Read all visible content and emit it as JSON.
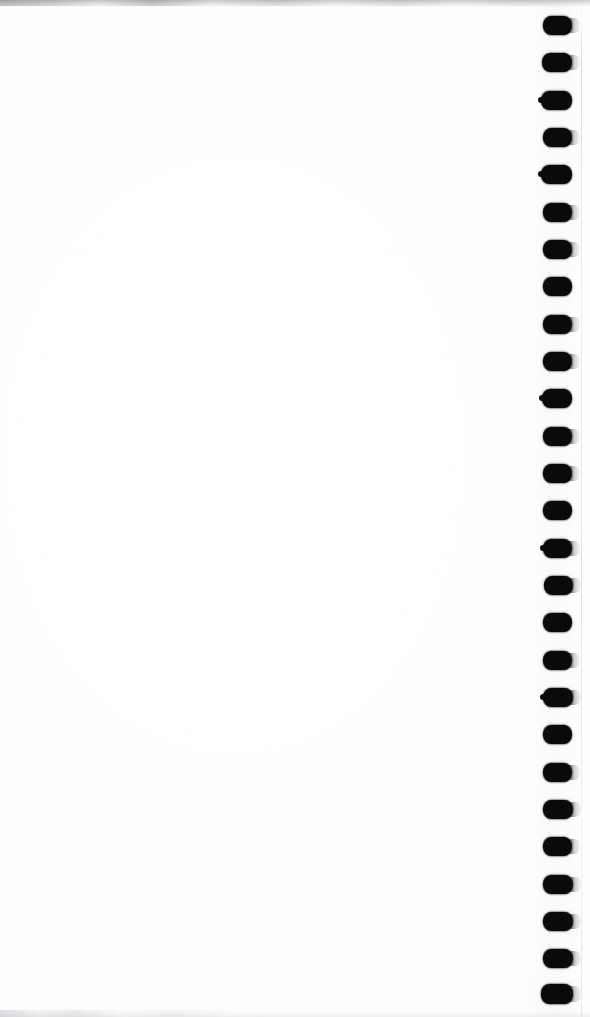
{
  "document": {
    "title": "Scanned blank page",
    "kind": "scanned-paper-page",
    "page_content_text": "",
    "width_px": 590,
    "height_px": 1017,
    "background_color": "#fefefe",
    "paper_color": "#ffffff"
  },
  "binder_holes": {
    "label": "punched binder holes",
    "count": 27,
    "shape": "rounded-rectangle",
    "color": "#0a0a0a",
    "column_left_px": 541,
    "hole_width_px": 30,
    "hole_height_px": 19,
    "first_hole_top_px": 16,
    "vertical_spacing_px": 37.3,
    "holes": [
      {
        "index": 1,
        "top": 16,
        "left": 543,
        "width": 29,
        "height": 19,
        "bleed": true,
        "nick": false
      },
      {
        "index": 2,
        "top": 53,
        "left": 542,
        "width": 30,
        "height": 19,
        "bleed": true,
        "nick": false
      },
      {
        "index": 3,
        "top": 91,
        "left": 541,
        "width": 31,
        "height": 19,
        "bleed": false,
        "nick": true
      },
      {
        "index": 4,
        "top": 128,
        "left": 543,
        "width": 29,
        "height": 19,
        "bleed": true,
        "nick": false
      },
      {
        "index": 5,
        "top": 165,
        "left": 541,
        "width": 31,
        "height": 19,
        "bleed": false,
        "nick": true
      },
      {
        "index": 6,
        "top": 203,
        "left": 543,
        "width": 29,
        "height": 19,
        "bleed": true,
        "nick": false
      },
      {
        "index": 7,
        "top": 240,
        "left": 543,
        "width": 29,
        "height": 19,
        "bleed": true,
        "nick": false
      },
      {
        "index": 8,
        "top": 277,
        "left": 543,
        "width": 29,
        "height": 19,
        "bleed": false,
        "nick": false
      },
      {
        "index": 9,
        "top": 315,
        "left": 543,
        "width": 29,
        "height": 19,
        "bleed": true,
        "nick": false
      },
      {
        "index": 10,
        "top": 352,
        "left": 543,
        "width": 29,
        "height": 19,
        "bleed": true,
        "nick": false
      },
      {
        "index": 11,
        "top": 389,
        "left": 542,
        "width": 30,
        "height": 19,
        "bleed": false,
        "nick": true
      },
      {
        "index": 12,
        "top": 427,
        "left": 543,
        "width": 29,
        "height": 19,
        "bleed": true,
        "nick": false
      },
      {
        "index": 13,
        "top": 464,
        "left": 543,
        "width": 29,
        "height": 19,
        "bleed": true,
        "nick": false
      },
      {
        "index": 14,
        "top": 501,
        "left": 543,
        "width": 29,
        "height": 19,
        "bleed": false,
        "nick": false
      },
      {
        "index": 15,
        "top": 539,
        "left": 543,
        "width": 29,
        "height": 19,
        "bleed": true,
        "nick": true
      },
      {
        "index": 16,
        "top": 576,
        "left": 544,
        "width": 29,
        "height": 19,
        "bleed": true,
        "nick": false
      },
      {
        "index": 17,
        "top": 613,
        "left": 543,
        "width": 29,
        "height": 19,
        "bleed": false,
        "nick": false
      },
      {
        "index": 18,
        "top": 651,
        "left": 543,
        "width": 29,
        "height": 19,
        "bleed": true,
        "nick": false
      },
      {
        "index": 19,
        "top": 688,
        "left": 543,
        "width": 30,
        "height": 19,
        "bleed": true,
        "nick": true
      },
      {
        "index": 20,
        "top": 725,
        "left": 543,
        "width": 29,
        "height": 19,
        "bleed": false,
        "nick": false
      },
      {
        "index": 21,
        "top": 763,
        "left": 543,
        "width": 29,
        "height": 19,
        "bleed": true,
        "nick": false
      },
      {
        "index": 22,
        "top": 800,
        "left": 543,
        "width": 30,
        "height": 19,
        "bleed": true,
        "nick": false
      },
      {
        "index": 23,
        "top": 837,
        "left": 543,
        "width": 29,
        "height": 19,
        "bleed": true,
        "nick": false
      },
      {
        "index": 24,
        "top": 875,
        "left": 543,
        "width": 30,
        "height": 19,
        "bleed": true,
        "nick": false
      },
      {
        "index": 25,
        "top": 912,
        "left": 543,
        "width": 30,
        "height": 19,
        "bleed": true,
        "nick": false
      },
      {
        "index": 26,
        "top": 949,
        "left": 543,
        "width": 30,
        "height": 19,
        "bleed": true,
        "nick": false
      },
      {
        "index": 27,
        "top": 984,
        "left": 541,
        "width": 32,
        "height": 20,
        "bleed": true,
        "nick": false
      }
    ]
  },
  "scan_artifacts": {
    "top_smudge": {
      "label": "top edge scanner smudge",
      "top": 0,
      "height": 8,
      "color": "#6c6c70"
    },
    "bottom_smudge": {
      "label": "bottom edge scanner smudge",
      "height": 9,
      "color": "#afafb4"
    },
    "right_paper_edge": {
      "label": "right paper edge line",
      "left": 581,
      "color": "#bcbcc2"
    },
    "margin_shade": {
      "label": "binder margin shading",
      "left": 524,
      "width": 56
    }
  }
}
